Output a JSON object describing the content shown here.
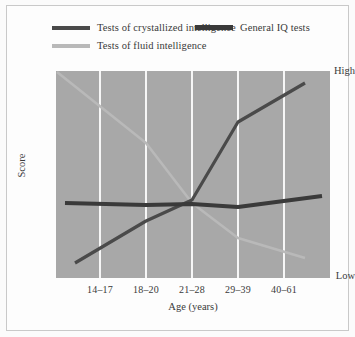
{
  "chart_data": {
    "type": "line",
    "title": "",
    "xlabel": "Age (years)",
    "ylabel": "Score",
    "categories": [
      "14–17",
      "18–20",
      "21–28",
      "29–39",
      "40–61"
    ],
    "ytick_labels": [
      "High",
      "Low"
    ],
    "ylim": [
      0,
      100
    ],
    "ylim_labels": {
      "low": "Low",
      "high": "High"
    },
    "grid": "vertical-only",
    "legend_position": "top",
    "plot_background_color": "#a8a8a8",
    "gridline_color": "#ffffff",
    "series": [
      {
        "name": "Tests of crystallized intelligence",
        "color": "#4a4a4a",
        "width": 3.2,
        "values": [
          9,
          37,
          50,
          78,
          96
        ],
        "x_pixels": [
          75,
          146,
          192,
          238,
          305
        ],
        "y_pixels": [
          263,
          221,
          200,
          122,
          83
        ]
      },
      {
        "name": "General IQ tests",
        "color": "#3a3a3a",
        "width": 4.0,
        "values": [
          52,
          51,
          50,
          49,
          57
        ],
        "x_pixels": [
          65,
          146,
          192,
          238,
          322
        ],
        "y_pixels": [
          203,
          205,
          204,
          207,
          196
        ]
      },
      {
        "name": "Tests of fluid intelligence",
        "color": "#b9b9b9",
        "width": 2.6,
        "values": [
          99,
          72,
          52,
          32,
          11
        ],
        "x_pixels": [
          57,
          146,
          192,
          238,
          305
        ],
        "y_pixels": [
          72,
          143,
          203,
          238,
          258
        ]
      }
    ]
  },
  "legend": {
    "items": [
      {
        "label": "Tests of crystallized intelligence",
        "color": "#4a4a4a",
        "thickness": "4px"
      },
      {
        "label": "General IQ tests",
        "color": "#3a3a3a",
        "thickness": "5px"
      },
      {
        "label": "Tests of fluid intelligence",
        "color": "#b9b9b9",
        "thickness": "4px"
      }
    ]
  },
  "axes": {
    "y_high": "High",
    "y_low": "Low",
    "y_title": "Score",
    "x_title": "Age (years)",
    "x_ticks": [
      "14–17",
      "18–20",
      "21–28",
      "29–39",
      "40–61"
    ]
  }
}
